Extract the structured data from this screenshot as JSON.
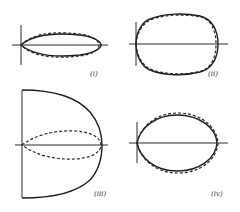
{
  "figure": {
    "panels": [
      {
        "id": "i",
        "label": "(i)",
        "description": "narrow forward lobe, solid and dashed nearly coincident"
      },
      {
        "id": "ii",
        "label": "(ii)",
        "description": "wide cardioid-like loop, solid and dashed nearly coincident"
      },
      {
        "id": "iii",
        "label": "(iii)",
        "description": "solid D-shaped semicircle with inner dashed narrow lobe"
      },
      {
        "id": "iv",
        "label": "(iv)",
        "description": "elliptical loop, solid and dashed nearly coincident"
      }
    ],
    "legend_styles": {
      "solid": "solid curve",
      "dashed": "dashed curve"
    },
    "colors": {
      "line": "#1e1e1e",
      "background": "#ffffff"
    }
  }
}
